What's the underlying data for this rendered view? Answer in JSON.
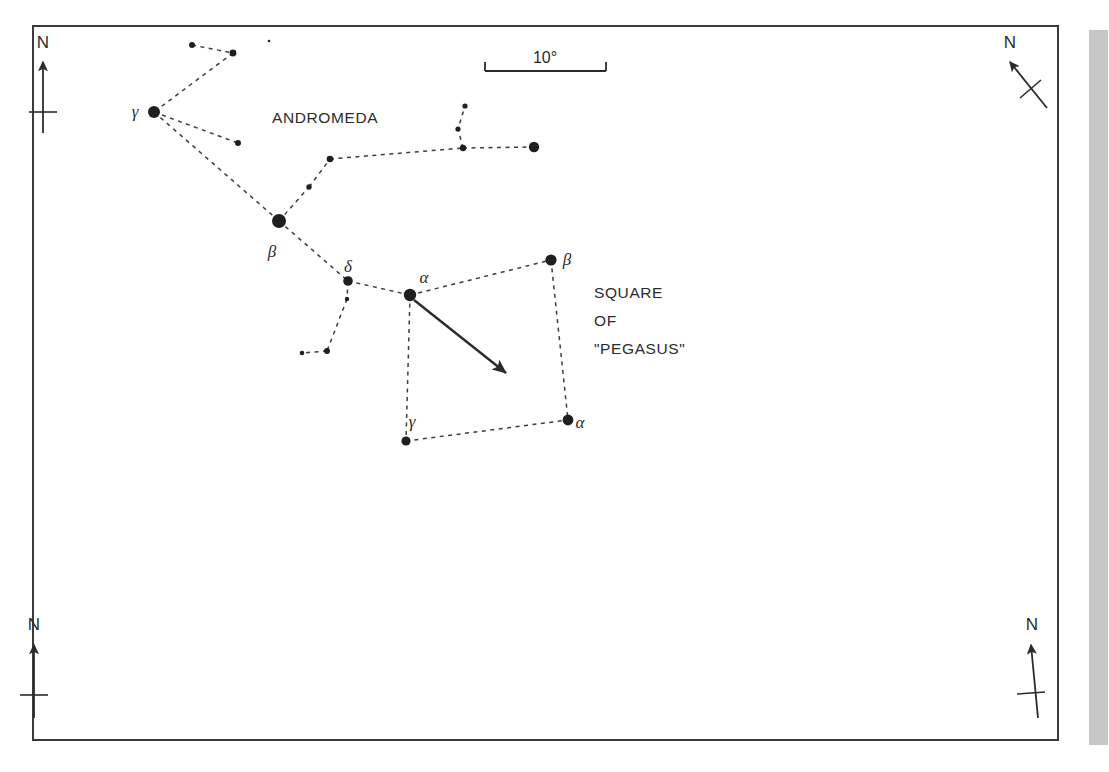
{
  "figure": {
    "kind": "star-chart",
    "background_color": "#ffffff",
    "ink_color": "#2b2b2b",
    "frame": {
      "x": 33,
      "y": 26,
      "width": 1025,
      "height": 714,
      "stroke": "#3a3a3a",
      "stroke_width": 2
    },
    "side_bar": {
      "x": 1089,
      "y": 30,
      "width": 19,
      "height": 715,
      "color": "#c6c6c6"
    }
  },
  "scale_bar": {
    "label": "10°",
    "label_x": 545,
    "label_y": 63,
    "x1": 485,
    "x2": 606,
    "y": 71,
    "tick_height": 9,
    "degrees": 10
  },
  "constellation_labels": [
    {
      "name": "andromeda-label",
      "text": "ANDROMEDA",
      "x": 272,
      "y": 123,
      "size": 15.5,
      "anchor": "start"
    },
    {
      "name": "pegasus-label-line1",
      "text": "SQUARE",
      "x": 594,
      "y": 298,
      "size": 15.5,
      "anchor": "start"
    },
    {
      "name": "pegasus-label-line2",
      "text": "OF",
      "x": 594,
      "y": 326,
      "size": 15.5,
      "anchor": "start"
    },
    {
      "name": "pegasus-label-line3",
      "text": "\"PEGASUS\"",
      "x": 594,
      "y": 354,
      "size": 15.5,
      "anchor": "start"
    }
  ],
  "star_labels": [
    {
      "name": "label-gamma-andromedae",
      "text": "γ",
      "x": 135,
      "y": 117,
      "size": 17
    },
    {
      "name": "label-beta-andromedae",
      "text": "β",
      "x": 272,
      "y": 257,
      "size": 17
    },
    {
      "name": "label-delta-andromedae",
      "text": "δ",
      "x": 348,
      "y": 272,
      "size": 17
    },
    {
      "name": "label-alpha-andromedae",
      "text": "α",
      "x": 424,
      "y": 283,
      "size": 17
    },
    {
      "name": "label-beta-pegasi",
      "text": "β",
      "x": 567,
      "y": 265,
      "size": 17
    },
    {
      "name": "label-alpha-pegasi",
      "text": "α",
      "x": 580,
      "y": 428,
      "size": 17
    },
    {
      "name": "label-gamma-pegasi",
      "text": "γ",
      "x": 412,
      "y": 427,
      "size": 17
    }
  ],
  "stars": [
    {
      "id": "and-ups-top",
      "x": 192,
      "y": 45,
      "r": 3.0
    },
    {
      "id": "and-chain-b",
      "x": 233,
      "y": 53,
      "r": 3.4
    },
    {
      "id": "and-speck",
      "x": 269,
      "y": 41,
      "r": 1.3
    },
    {
      "id": "gamma-and",
      "x": 154,
      "y": 112,
      "r": 6.0
    },
    {
      "id": "and-pi",
      "x": 238,
      "y": 143,
      "r": 3.0
    },
    {
      "id": "beta-and",
      "x": 279,
      "y": 221,
      "r": 7.0
    },
    {
      "id": "and-mu",
      "x": 330,
      "y": 159,
      "r": 3.3
    },
    {
      "id": "and-nu",
      "x": 309,
      "y": 187,
      "r": 2.7
    },
    {
      "id": "and-junction",
      "x": 463,
      "y": 148,
      "r": 3.2
    },
    {
      "id": "and-branch-m",
      "x": 458,
      "y": 129,
      "r": 2.6
    },
    {
      "id": "and-branch-t",
      "x": 465,
      "y": 106,
      "r": 2.6
    },
    {
      "id": "and-right",
      "x": 534,
      "y": 147,
      "r": 5.2
    },
    {
      "id": "delta-and",
      "x": 348,
      "y": 281,
      "r": 4.8
    },
    {
      "id": "and-small-1",
      "x": 347,
      "y": 299,
      "r": 2.2
    },
    {
      "id": "and-bend",
      "x": 327,
      "y": 351,
      "r": 3.0
    },
    {
      "id": "and-small-2",
      "x": 302,
      "y": 353,
      "r": 2.3
    },
    {
      "id": "alpha-and",
      "x": 410,
      "y": 295,
      "r": 6.2
    },
    {
      "id": "beta-peg",
      "x": 551,
      "y": 260,
      "r": 5.6
    },
    {
      "id": "alpha-peg",
      "x": 568,
      "y": 420,
      "r": 5.4
    },
    {
      "id": "gamma-peg",
      "x": 406,
      "y": 441,
      "r": 4.6
    }
  ],
  "constellation_lines": [
    {
      "name": "line-upstop-chainb",
      "points": "192,45 233,53"
    },
    {
      "name": "line-chainb-gamma",
      "points": "233,53 154,112"
    },
    {
      "name": "line-gamma-pi",
      "points": "154,112 238,143"
    },
    {
      "name": "line-gamma-beta",
      "points": "154,112 279,221"
    },
    {
      "name": "line-beta-nu",
      "points": "279,221 309,187"
    },
    {
      "name": "line-nu-mu",
      "points": "309,187 330,159"
    },
    {
      "name": "line-mu-junction",
      "points": "330,159 463,148"
    },
    {
      "name": "line-junction-branch",
      "points": "463,148 458,129 465,106"
    },
    {
      "name": "line-junction-right",
      "points": "463,148 534,147"
    },
    {
      "name": "line-beta-delta",
      "points": "279,221 348,281"
    },
    {
      "name": "line-delta-small1",
      "points": "348,281 347,299"
    },
    {
      "name": "line-small1-bend",
      "points": "347,299 327,351"
    },
    {
      "name": "line-bend-small2",
      "points": "327,351 302,353"
    },
    {
      "name": "line-delta-alpha",
      "points": "348,281 410,295"
    },
    {
      "name": "line-alpha-betapeg",
      "points": "410,295 551,260"
    },
    {
      "name": "line-alpha-gammapeg",
      "points": "410,295 406,441"
    },
    {
      "name": "line-betapeg-alphapeg",
      "points": "551,260 568,420"
    },
    {
      "name": "line-gammapeg-alphapeg",
      "points": "406,441 568,420"
    }
  ],
  "pointer_arrow": {
    "name": "m31-pointer-arrow",
    "from_x": 414,
    "from_y": 300,
    "to_x": 506,
    "to_y": 373,
    "stroke_width": 2.4
  },
  "compasses": [
    {
      "id": "compass-top-left",
      "label": "N",
      "label_x": 43,
      "label_y": 48,
      "shaft_x1": 43,
      "shaft_y1": 133,
      "shaft_x2": 43,
      "shaft_y2": 62,
      "tick_x1": 29,
      "tick_y1": 112,
      "tick_x2": 57,
      "tick_y2": 112
    },
    {
      "id": "compass-top-right",
      "label": "N",
      "label_x": 1010,
      "label_y": 48,
      "shaft_x1": 1047,
      "shaft_y1": 108,
      "shaft_x2": 1010,
      "shaft_y2": 62,
      "tick_x1": 1020,
      "tick_y1": 98,
      "tick_x2": 1041,
      "tick_y2": 80
    },
    {
      "id": "compass-bottom-left",
      "label": "N",
      "label_x": 34,
      "label_y": 630,
      "shaft_x1": 34,
      "shaft_y1": 718,
      "shaft_x2": 34,
      "shaft_y2": 645,
      "tick_x1": 20,
      "tick_y1": 695,
      "tick_x2": 48,
      "tick_y2": 695
    },
    {
      "id": "compass-bottom-right",
      "label": "N",
      "label_x": 1032,
      "label_y": 630,
      "shaft_x1": 1038,
      "shaft_y1": 718,
      "shaft_x2": 1031,
      "shaft_y2": 645,
      "tick_x1": 1017,
      "tick_y1": 694,
      "tick_x2": 1045,
      "tick_y2": 692
    }
  ]
}
